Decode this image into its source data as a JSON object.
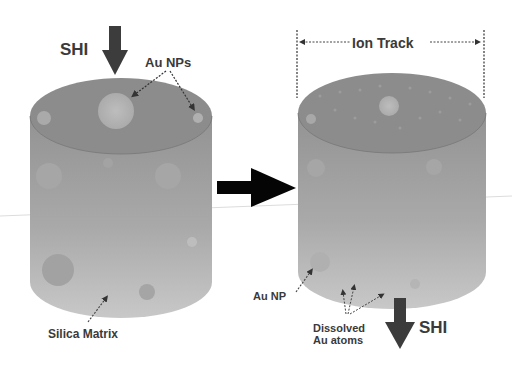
{
  "diagram": {
    "left_panel": {
      "incident_beam_label": "SHI",
      "nanoparticles_label": "Au NPs",
      "matrix_label": "Silica Matrix"
    },
    "transition_arrow": "right-arrow",
    "right_panel": {
      "track_label": "Ion Track",
      "nanoparticle_label": "Au NP",
      "dissolved_label_line1": "Dissolved",
      "dissolved_label_line2": "Au atoms",
      "exit_beam_label": "SHI"
    },
    "colors": {
      "cylinder_top": "#8a8a8a",
      "cylinder_body_top": "#939393",
      "cylinder_body_bottom": "#c4c4c4",
      "particle": "#b5b5b5",
      "arrow_dark": "#3c3c3c",
      "arrow_black": "#050505",
      "text": "#3a3a3a"
    }
  }
}
